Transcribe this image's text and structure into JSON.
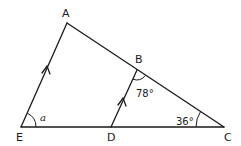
{
  "diagram": {
    "type": "geometry-triangle-parallel-lines",
    "points": {
      "A": {
        "label": "A",
        "x": 67,
        "y": 23
      },
      "B": {
        "label": "B",
        "x": 137,
        "y": 70
      },
      "C": {
        "label": "C",
        "x": 224,
        "y": 127
      },
      "D": {
        "label": "D",
        "x": 111,
        "y": 127
      },
      "E": {
        "label": "E",
        "x": 21,
        "y": 127
      }
    },
    "segments": [
      "EA",
      "AC",
      "EC",
      "DB"
    ],
    "parallel": [
      "EA",
      "DB"
    ],
    "angles": {
      "E": {
        "label": "a",
        "italic": true
      },
      "B": {
        "label": "78°",
        "between": "DB-BC"
      },
      "C": {
        "label": "36°"
      }
    },
    "stroke_color": "#1a1a1a",
    "background": "#ffffff"
  }
}
